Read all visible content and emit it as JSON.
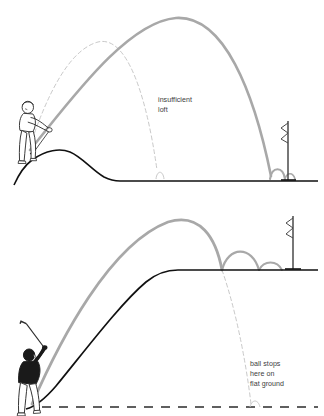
{
  "diagram": {
    "colors": {
      "background": "#ffffff",
      "ground_line": "#111111",
      "trajectory_gray": "#a8a8a8",
      "trajectory_dashed": "#c9c9c9",
      "annotation_text": "#3d3d3d",
      "golfer_shirt_dark": "#1a1a1a",
      "golfer_outline": "#2b2b2b",
      "flagstick": "#4a4a4a"
    },
    "panels": [
      {
        "id": "top-panel",
        "name": "insufficient-loft-panel",
        "annotation": {
          "line1": "insufficient",
          "line2": "loft",
          "x": 158,
          "y": 100
        },
        "golfer": {
          "name": "golfer-address-uphill",
          "pose": "addressing ball on downslope",
          "shirt": "light",
          "x": 22,
          "y": 130
        },
        "flagstick": {
          "name": "flagstick-top",
          "x": 288,
          "base_y": 180,
          "top_y": 121
        },
        "ground": {
          "description": "mound rising from low tee area to a crest then falling to flat fairway",
          "flat_y": 180
        },
        "trajectories": [
          {
            "name": "high-loft-shot",
            "style": "solid-gray",
            "apex_x": 176,
            "apex_y": 18,
            "land_x": 272
          },
          {
            "name": "low-loft-shot",
            "style": "dashed-gray",
            "apex_x": 98,
            "apex_y": 41,
            "land_x": 158
          }
        ]
      },
      {
        "id": "bottom-panel",
        "name": "upslope-shot-panel",
        "annotation": {
          "line1": "ball stops",
          "line2": "here on",
          "line3": "flat ground",
          "x": 250,
          "y": 366
        },
        "golfer": {
          "name": "golfer-follow-through",
          "pose": "full follow-through with club raised",
          "shirt": "dark",
          "x": 25,
          "y": 355
        },
        "flagstick": {
          "name": "flagstick-bottom",
          "x": 293,
          "base_y": 270,
          "top_y": 216
        },
        "ground": {
          "description": "steep upslope from low ground rising to an elevated flat green plateau",
          "plateau_y": 270,
          "reference_dashed_y": 407
        },
        "trajectories": [
          {
            "name": "shot-onto-plateau",
            "style": "solid-gray",
            "apex_x": 168,
            "apex_y": 222,
            "land_x": 222
          },
          {
            "name": "shot-on-flat-ground",
            "style": "dashed-gray",
            "apex_x": 168,
            "apex_y": 222,
            "land_x": 253
          }
        ]
      }
    ]
  }
}
